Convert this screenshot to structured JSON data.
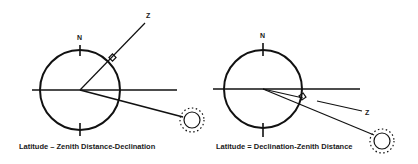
{
  "diagrams": [
    {
      "id": "left",
      "caption": "Latitude – Zenith Distance-Declination",
      "north_label": "N",
      "zenith_label": "Z",
      "case": "zenith north of sun",
      "circle": {
        "cx": 80,
        "cy": 90,
        "r": 40
      },
      "horizon": {
        "x1": 32,
        "x2": 177
      },
      "zenith_line": {
        "x1": 80,
        "y1": 90,
        "x2": 145,
        "y2": 23
      },
      "sun_line": {
        "x1": 80,
        "y1": 90,
        "x2": 183,
        "y2": 117
      },
      "sun": {
        "cx": 192,
        "cy": 120,
        "r": 9
      }
    },
    {
      "id": "right",
      "caption": "Latitude = Declination-Zenith Distance",
      "north_label": "N",
      "zenith_label": "Z",
      "case": "zenith between equator and sun",
      "circle": {
        "cx": 263,
        "cy": 89,
        "r": 39
      },
      "horizon": {
        "x1": 213,
        "x2": 360
      },
      "zenith_line": {
        "x1": 263,
        "y1": 89,
        "x2": 303,
        "y2": 98
      },
      "zenith_leader": {
        "x1": 317,
        "y1": 101,
        "x2": 362,
        "y2": 111
      },
      "sun_line": {
        "x1": 263,
        "y1": 89,
        "x2": 374,
        "y2": 135
      },
      "sun": {
        "cx": 382,
        "cy": 141,
        "r": 9
      }
    }
  ],
  "colors": {
    "stroke": "#111111",
    "background": "#ffffff"
  }
}
